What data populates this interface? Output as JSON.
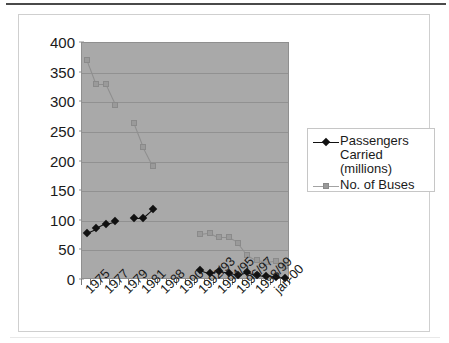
{
  "chart_data": {
    "type": "line",
    "title": "",
    "xlabel": "",
    "ylabel": "",
    "ylim": [
      0,
      400
    ],
    "ytick_step": 50,
    "yticks": [
      "400",
      "350",
      "300",
      "250",
      "200",
      "150",
      "100",
      "50",
      "0"
    ],
    "grid": true,
    "legend_position": "right",
    "plot_background": "#a9a9a9",
    "categories": [
      "1975",
      "1976",
      "1977",
      "1978",
      "1979",
      "1980",
      "1981",
      "1984",
      "1988",
      "1989",
      "1990",
      "1991",
      "1992/93",
      "1993/94",
      "1994/95",
      "1995/96",
      "1996/97",
      "1997/98",
      "1998/99",
      "1999/00",
      "jan-00",
      ""
    ],
    "xtick_labels": [
      "1975",
      "1977",
      "1979",
      "1981",
      "1988",
      "1990",
      "1992/93",
      "1994/95",
      "1996/97",
      "1998/99",
      "jan-00"
    ],
    "series": [
      {
        "name": "Passengers Carried (millions)",
        "color": "#111111",
        "marker": "diamond",
        "values": [
          80,
          87,
          95,
          99,
          null,
          105,
          105,
          119,
          null,
          null,
          null,
          null,
          17,
          11,
          15,
          12,
          9,
          14,
          8,
          6,
          5,
          4
        ]
      },
      {
        "name": "No. of Buses",
        "color": "#9a9a9a",
        "marker": "square",
        "values": [
          372,
          330,
          330,
          296,
          null,
          265,
          224,
          193,
          null,
          null,
          null,
          null,
          78,
          80,
          72,
          72,
          63,
          42,
          33,
          30,
          32,
          24
        ]
      }
    ]
  },
  "legend": {
    "entries": [
      {
        "label_line1": "Passengers",
        "label_line2": "Carried",
        "label_line3": "(millions)",
        "marker": "diamond-marker"
      },
      {
        "label_line1": "No. of Buses",
        "label_line2": "",
        "label_line3": "",
        "marker": "square-marker"
      }
    ]
  }
}
